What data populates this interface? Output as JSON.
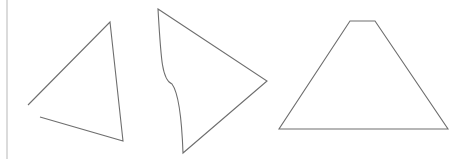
{
  "diagram": {
    "stroke_color": "#6e6e6e",
    "divider_color": "#cfcfcf",
    "background_color": "#ffffff",
    "shapes": [
      {
        "name": "open-triangle",
        "kind": "polyline"
      },
      {
        "name": "curved-kite",
        "kind": "path"
      },
      {
        "name": "trapezoid",
        "kind": "polygon"
      }
    ]
  }
}
